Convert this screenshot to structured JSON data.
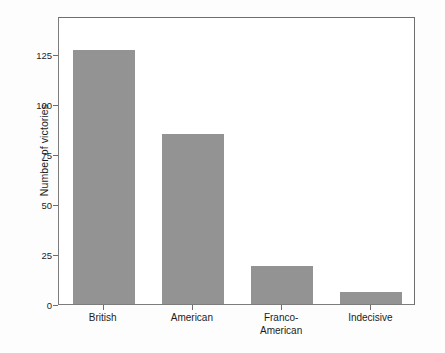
{
  "chart_data": {
    "type": "bar",
    "title": "",
    "subtitle": "",
    "xlabel": "",
    "ylabel": "Number of victories",
    "categories": [
      "British",
      "American",
      "Franco-American",
      "Indecisive"
    ],
    "category_lines": [
      [
        "British"
      ],
      [
        "American"
      ],
      [
        "Franco-",
        "American"
      ],
      [
        "Indecisive"
      ]
    ],
    "values": [
      127,
      85,
      19,
      6
    ],
    "ylim": [
      0,
      144
    ],
    "yticks": [
      0,
      25,
      50,
      75,
      100,
      125
    ],
    "ytick_labels": [
      "0",
      "25",
      "50",
      "75",
      "100",
      "125"
    ],
    "grid": false,
    "legend": false,
    "bar_color": "#939393",
    "frame_color": "#6e6e6e",
    "plot_background": "#ffffff",
    "figure_background": "#fdfdfd",
    "text_color": "#1c1c1c"
  }
}
